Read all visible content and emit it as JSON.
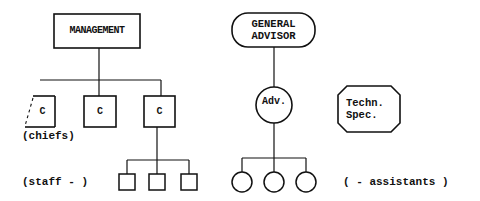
{
  "diagram": {
    "type": "organization-chart",
    "left_tree": {
      "root": {
        "label": "MANAGEMENT",
        "shape": "rectangle"
      },
      "chiefs": [
        {
          "label": "C",
          "shape": "rectangle",
          "note": "partially dashed left edge"
        },
        {
          "label": "C",
          "shape": "rectangle"
        },
        {
          "label": "C",
          "shape": "rectangle"
        }
      ],
      "chiefs_caption": "(chiefs)",
      "staff": [
        {
          "label": "",
          "shape": "small-square"
        },
        {
          "label": "",
          "shape": "small-square"
        },
        {
          "label": "",
          "shape": "small-square"
        }
      ],
      "staff_caption": "(staff - )"
    },
    "right_tree": {
      "root": {
        "label_line1": "GENERAL",
        "label_line2": "ADVISOR",
        "shape": "rounded-pill"
      },
      "advisor": {
        "label": "Adv.",
        "shape": "circle"
      },
      "assistants": [
        {
          "label": "",
          "shape": "small-circle"
        },
        {
          "label": "",
          "shape": "small-circle"
        },
        {
          "label": "",
          "shape": "small-circle"
        }
      ],
      "assistants_caption": "( - assistants )"
    },
    "standalone": {
      "label_line1": "Techn.",
      "label_line2": "Spec.",
      "shape": "octagon"
    },
    "colors": {
      "stroke": "#111111",
      "background": "#ffffff"
    }
  }
}
